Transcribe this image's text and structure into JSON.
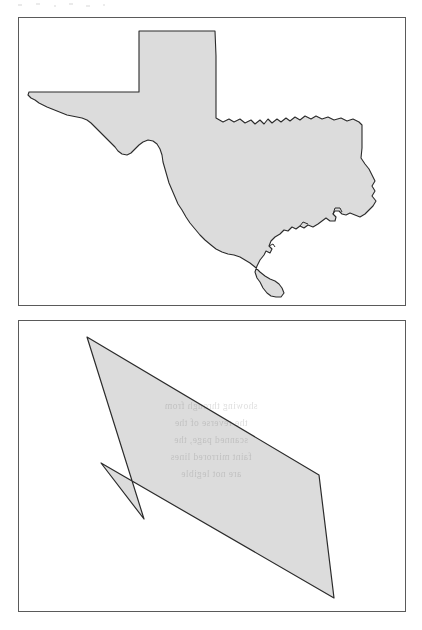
{
  "document": {
    "type": "scanned-figure-page",
    "page_background": "#ffffff",
    "panel_border_color": "#5a5a5a",
    "shape_fill_color": "#dcdcdc",
    "shape_outline_color": "#2b2b2b"
  },
  "panels": [
    {
      "id": "map-panel",
      "name": "texas-state-outline-panel",
      "caption": "",
      "shape_label": "Texas state boundary",
      "shape_kind": "detailed-polygon",
      "fill": "#dcdcdc",
      "stroke": "#2b2b2b",
      "bounds": {
        "x": 18,
        "y": 17,
        "width": 388,
        "height": 289
      }
    },
    {
      "id": "hull-panel",
      "name": "convex-hull-panel",
      "caption": "",
      "shape_label": "Convex hull approximation of Texas",
      "shape_kind": "convex-polygon",
      "fill": "#dcdcdc",
      "stroke": "#2b2b2b",
      "bounds": {
        "x": 18,
        "y": 320,
        "width": 388,
        "height": 292
      },
      "vertices": [
        {
          "x": 68,
          "y": 16
        },
        {
          "x": 300,
          "y": 154
        },
        {
          "x": 315,
          "y": 277
        },
        {
          "x": 82,
          "y": 142
        },
        {
          "x": 125,
          "y": 198
        }
      ]
    }
  ],
  "artifacts": {
    "bleed_through_text": "showing through from\nthe reverse of the\nscanned page, the\nfaint mirrored lines\nare not legible",
    "scan_speckle_label": "scanner dust marks"
  }
}
